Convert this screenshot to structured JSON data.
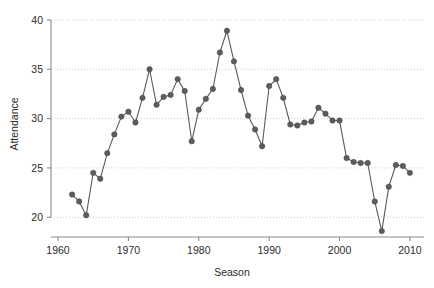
{
  "chart_data": {
    "type": "line",
    "title": "",
    "xlabel": "Season",
    "ylabel": "Attendance",
    "xlim": [
      1959,
      2012
    ],
    "ylim": [
      18.0,
      40.6
    ],
    "xticks": [
      1960,
      1970,
      1980,
      1990,
      2000,
      2010
    ],
    "xtick_labels": [
      "1960",
      "1970",
      "1980",
      "1990",
      "2000",
      "2010"
    ],
    "yticks": [
      20,
      25,
      30,
      35,
      40
    ],
    "ytick_labels": [
      "20",
      "25",
      "30",
      "35",
      "40"
    ],
    "grid": "horizontal-dotted",
    "legend": "none",
    "markers": "filled-circle",
    "series": [
      {
        "name": "Attendance",
        "color": "#5d5d5d",
        "x": [
          1962,
          1963,
          1964,
          1965,
          1966,
          1967,
          1968,
          1969,
          1970,
          1971,
          1972,
          1973,
          1974,
          1975,
          1976,
          1977,
          1978,
          1979,
          1980,
          1981,
          1982,
          1983,
          1984,
          1985,
          1986,
          1987,
          1988,
          1989,
          1990,
          1991,
          1992,
          1993,
          1994,
          1995,
          1996,
          1997,
          1998,
          1999,
          2000,
          2001,
          2002,
          2003,
          2004,
          2005,
          2006,
          2007,
          2008,
          2009,
          2010
        ],
        "values": [
          22.3,
          21.6,
          20.2,
          24.5,
          23.9,
          26.5,
          28.4,
          30.2,
          30.7,
          29.6,
          32.1,
          35.0,
          31.4,
          32.2,
          32.4,
          34.0,
          32.8,
          27.7,
          30.9,
          32.0,
          33.0,
          36.7,
          38.9,
          35.8,
          32.9,
          30.3,
          28.9,
          27.2,
          33.3,
          34.0,
          32.1,
          29.4,
          29.3,
          29.6,
          29.7,
          31.1,
          30.5,
          29.8,
          29.8,
          26.0,
          25.6,
          25.5,
          25.5,
          21.6,
          18.6,
          23.1,
          25.3,
          25.2,
          24.5
        ]
      }
    ]
  }
}
